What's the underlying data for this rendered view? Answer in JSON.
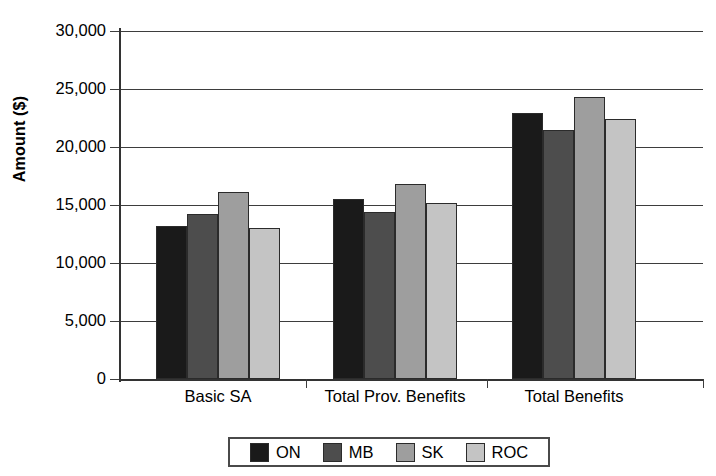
{
  "chart_data": {
    "type": "bar",
    "title": "",
    "xlabel": "",
    "ylabel": "Amount ($)",
    "categories": [
      "Basic SA",
      "Total Prov. Benefits",
      "Total Benefits"
    ],
    "series": [
      {
        "name": "ON",
        "color": "#1a1a1a",
        "values": [
          13200,
          15500,
          22900
        ]
      },
      {
        "name": "MB",
        "color": "#4d4d4d",
        "values": [
          14200,
          14400,
          21500
        ]
      },
      {
        "name": "SK",
        "color": "#9e9e9e",
        "values": [
          16100,
          16800,
          24300
        ]
      },
      {
        "name": "ROC",
        "color": "#c4c4c4",
        "values": [
          13000,
          15200,
          22400
        ]
      }
    ],
    "ylim": [
      0,
      30000
    ],
    "ytick_values": [
      30000,
      25000,
      20000,
      15000,
      10000,
      5000,
      0
    ],
    "ytick_labels": [
      "30,000",
      "25,000",
      "20,000",
      "15,000",
      "10,000",
      "5,000",
      "0"
    ],
    "grid": true,
    "legend_position": "bottom"
  }
}
